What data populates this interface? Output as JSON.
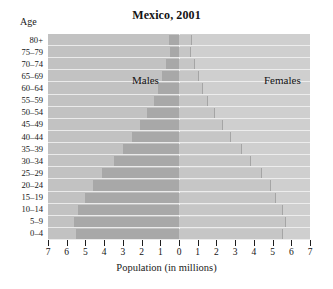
{
  "chart_data": {
    "type": "bar",
    "title": "Mexico, 2001",
    "subtype": "population-pyramid",
    "xlabel": "Population (in millions)",
    "ylabel": "Age",
    "xlim": [
      -7,
      7
    ],
    "xticks": [
      7,
      6,
      5,
      4,
      3,
      2,
      1,
      0,
      1,
      2,
      3,
      4,
      5,
      6,
      7
    ],
    "grid": false,
    "legend_position": "inside-top",
    "categories": [
      "80+",
      "75–79",
      "70–74",
      "65–69",
      "60–64",
      "55–59",
      "50–54",
      "45–49",
      "40–44",
      "35–39",
      "30–34",
      "25–29",
      "20–24",
      "15–19",
      "10–14",
      "5–9",
      "0–4"
    ],
    "series": [
      {
        "name": "Males",
        "side": "left",
        "color": "#a8a8a8",
        "values": [
          0.55,
          0.5,
          0.7,
          0.9,
          1.1,
          1.35,
          1.7,
          2.1,
          2.5,
          3.0,
          3.5,
          4.1,
          4.6,
          5.0,
          5.4,
          5.6,
          5.5
        ]
      },
      {
        "name": "Females",
        "side": "right",
        "color": "#c6c6c6",
        "values": [
          0.65,
          0.6,
          0.8,
          1.0,
          1.25,
          1.5,
          1.85,
          2.3,
          2.75,
          3.3,
          3.8,
          4.4,
          4.85,
          5.15,
          5.5,
          5.65,
          5.5
        ]
      }
    ]
  },
  "labels": {
    "males": "Males",
    "females": "Females"
  }
}
